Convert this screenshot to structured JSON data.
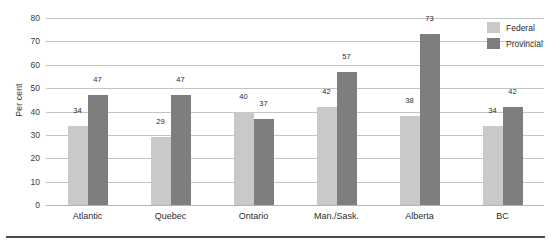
{
  "chart_data": {
    "type": "bar",
    "title": "",
    "xlabel": "",
    "ylabel": "Per cent",
    "ylim": [
      0,
      80
    ],
    "ytick_step": 10,
    "yticks": [
      80,
      70,
      60,
      50,
      40,
      30,
      20,
      10,
      0
    ],
    "grid": true,
    "legend_position": "top-right",
    "categories": [
      "Atlantic",
      "Quebec",
      "Ontario",
      "Man./Sask.",
      "Alberta",
      "BC"
    ],
    "series": [
      {
        "name": "Federal",
        "color": "#c9c9c9",
        "values": [
          34,
          29,
          40,
          42,
          38,
          34
        ]
      },
      {
        "name": "Provincial",
        "color": "#7e7e7e",
        "values": [
          47,
          47,
          37,
          57,
          73,
          42
        ]
      }
    ]
  },
  "legend": {
    "items": [
      {
        "label": "Federal"
      },
      {
        "label": "Provincial"
      }
    ]
  }
}
